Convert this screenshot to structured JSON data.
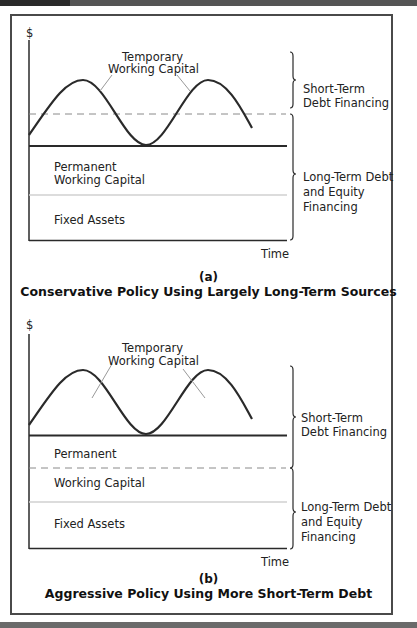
{
  "panels": [
    {
      "id": "a",
      "y_axis_label": "$",
      "x_axis_label": "Time",
      "curve_label": [
        "Temporary",
        "Working Capital"
      ],
      "region_labels": {
        "permanent_line1": "Permanent",
        "permanent_line2": "Working Capital",
        "fixed_assets": "Fixed Assets"
      },
      "brace_labels": {
        "short_term": [
          "Short-Term",
          "Debt Financing"
        ],
        "long_term": [
          "Long-Term Debt",
          "and Equity",
          "Financing"
        ]
      },
      "letter": "(a)",
      "title": "Conservative Policy Using Largely Long-Term Sources"
    },
    {
      "id": "b",
      "y_axis_label": "$",
      "x_axis_label": "Time",
      "curve_label": [
        "Temporary",
        "Working Capital"
      ],
      "region_labels": {
        "permanent_line1": "Permanent",
        "permanent_line2": "Working Capital",
        "fixed_assets": "Fixed Assets"
      },
      "brace_labels": {
        "short_term": [
          "Short-Term",
          "Debt Financing"
        ],
        "long_term": [
          "Long-Term Debt",
          "and Equity",
          "Financing"
        ]
      },
      "letter": "(b)",
      "title": "Aggressive Policy Using More Short-Term Debt"
    }
  ],
  "colors": {
    "line": "#2a2a2a",
    "dashed": "#8a8a8a",
    "fixed_divider": "#cfcfcf",
    "frame": "#4a4a4a"
  }
}
